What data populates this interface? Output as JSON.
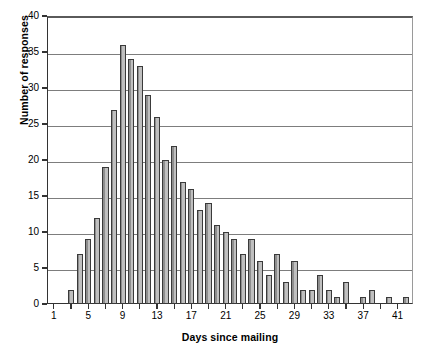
{
  "chart_data": {
    "type": "bar",
    "title": "",
    "xlabel": "Days since mailing",
    "ylabel": "Number of responses",
    "xlim": [
      0.2,
      42.8
    ],
    "ylim": [
      0,
      40
    ],
    "yticks": [
      0,
      5,
      10,
      15,
      20,
      25,
      30,
      35,
      40
    ],
    "xticks": [
      1,
      3,
      5,
      7,
      9,
      11,
      13,
      15,
      17,
      19,
      21,
      23,
      25,
      27,
      29,
      31,
      33,
      35,
      37,
      39,
      41
    ],
    "xtick_labels_shown": [
      1,
      5,
      9,
      13,
      17,
      21,
      25,
      29,
      33,
      37,
      41
    ],
    "grid": "horizontal",
    "legend": "none",
    "bar_color": "#bfbfbf",
    "bar_edge_color": "#3a3a3a",
    "categories": [
      1,
      2,
      3,
      4,
      5,
      6,
      7,
      8,
      9,
      10,
      11,
      12,
      13,
      14,
      15,
      16,
      17,
      18,
      19,
      20,
      21,
      22,
      23,
      24,
      25,
      26,
      27,
      28,
      29,
      30,
      31,
      32,
      33,
      34,
      35,
      36,
      37,
      38,
      39,
      40,
      41,
      42
    ],
    "values": [
      0,
      0,
      2,
      7,
      9,
      12,
      19,
      27,
      36,
      34,
      33,
      29,
      26,
      20,
      22,
      17,
      16,
      13,
      14,
      11,
      10,
      9,
      7,
      9,
      6,
      4,
      7,
      3,
      6,
      2,
      2,
      4,
      2,
      1,
      3,
      0,
      1,
      2,
      0,
      1,
      0,
      1
    ]
  },
  "axis": {
    "ytick_labels": [
      "0",
      "5",
      "10",
      "15",
      "20",
      "25",
      "30",
      "35",
      "40"
    ],
    "xtick_labels": [
      "1",
      "5",
      "9",
      "13",
      "17",
      "21",
      "25",
      "29",
      "33",
      "37",
      "41"
    ]
  }
}
